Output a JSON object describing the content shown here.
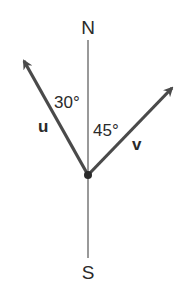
{
  "diagram": {
    "compass": {
      "north_label": "N",
      "south_label": "S"
    },
    "vectors": [
      {
        "name": "u",
        "label": "u",
        "angle_label": "30°",
        "direction": "30° west of north"
      },
      {
        "name": "v",
        "label": "v",
        "angle_label": "45°",
        "direction": "45° east of north"
      }
    ],
    "colors": {
      "axis": "#555555",
      "vector": "#4a4a4a",
      "text": "#2a2a2a",
      "background": "#ffffff"
    }
  }
}
